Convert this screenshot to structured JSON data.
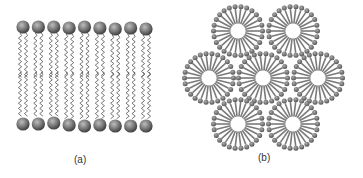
{
  "panels": [
    {
      "id": "a",
      "label": "(a)",
      "type": "lipid-bilayer",
      "heads_per_layer": 9
    },
    {
      "id": "b",
      "label": "(b)",
      "type": "micelle-cluster",
      "micelle_count": 7
    }
  ],
  "colors": {
    "head": "#6e6e6e",
    "tail": "#555555",
    "background": "#ffffff"
  }
}
